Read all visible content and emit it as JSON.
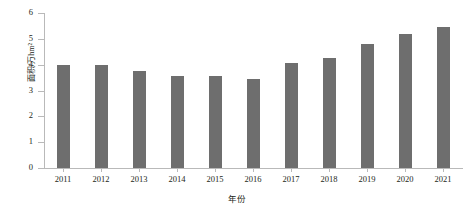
{
  "chart_data": {
    "type": "bar",
    "title": "",
    "xlabel": "年份",
    "ylabel": "面积/万hm²",
    "categories": [
      "2011",
      "2012",
      "2013",
      "2014",
      "2015",
      "2016",
      "2017",
      "2018",
      "2019",
      "2020",
      "2021"
    ],
    "values": [
      4.0,
      4.0,
      3.75,
      3.55,
      3.55,
      3.45,
      4.05,
      4.25,
      4.8,
      5.2,
      5.45
    ],
    "ylim": [
      0,
      6
    ],
    "yticks": [
      0,
      1,
      2,
      3,
      4,
      5,
      6
    ],
    "ytick_labels": [
      "0",
      "1",
      "2",
      "3",
      "4",
      "5",
      "6"
    ],
    "grid": false,
    "legend": false,
    "series": [
      {
        "name": "面积",
        "color": "#6e6e6e",
        "values": [
          4.0,
          4.0,
          3.75,
          3.55,
          3.55,
          3.45,
          4.05,
          4.25,
          4.8,
          5.2,
          5.45
        ]
      }
    ],
    "colors": {
      "bar": "#6e6e6e",
      "axis": "#b9b9b9",
      "text": "#231f20",
      "background": "#ffffff"
    }
  }
}
